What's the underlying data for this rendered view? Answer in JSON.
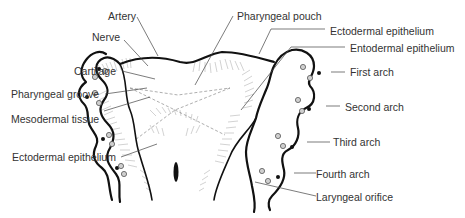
{
  "figure": {
    "labels_left": [
      {
        "id": "artery",
        "text": "Artery"
      },
      {
        "id": "nerve",
        "text": "Nerve"
      },
      {
        "id": "cartilage",
        "text": "Cartilage"
      },
      {
        "id": "pharyngeal-groove",
        "text": "Pharyngeal groove"
      },
      {
        "id": "mesodermal-tissue",
        "text": "Mesodermal tissue"
      },
      {
        "id": "ectodermal-epithelium-left",
        "text": "Ectodermal epithelium"
      }
    ],
    "labels_top": [
      {
        "id": "pharyngeal-pouch",
        "text": "Pharyngeal pouch"
      }
    ],
    "labels_right": [
      {
        "id": "ectodermal-epithelium-right",
        "text": "Ectodermal epithelium"
      },
      {
        "id": "entodermal-epithelium",
        "text": "Entodermal epithelium"
      },
      {
        "id": "first-arch",
        "text": "First arch"
      },
      {
        "id": "second-arch",
        "text": "Second arch"
      },
      {
        "id": "third-arch",
        "text": "Third arch"
      },
      {
        "id": "fourth-arch",
        "text": "Fourth arch"
      },
      {
        "id": "laryngeal-orifice",
        "text": "Laryngeal orifice"
      }
    ],
    "colors": {
      "outline": "#111111",
      "label_text": "#333333",
      "leader_line": "#444444",
      "hatching": "#9a9a9a",
      "background": "#ffffff"
    }
  }
}
